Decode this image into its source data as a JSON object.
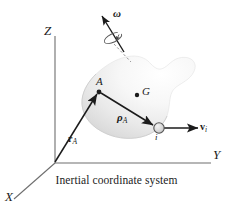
{
  "figure": {
    "caption": "Inertial coordinate system",
    "background_color": "#ffffff",
    "ink_color": "#1b1b1b",
    "body_fill_light": "#fbfbfb",
    "body_fill_dark": "#d2d2d2",
    "axes": [
      {
        "name": "Z",
        "label": "Z"
      },
      {
        "name": "Y",
        "label": "Y"
      },
      {
        "name": "X",
        "label": "X"
      }
    ],
    "points": [
      {
        "name": "A",
        "label": "A"
      },
      {
        "name": "G",
        "label": "G"
      },
      {
        "name": "i",
        "label": "i"
      }
    ],
    "vectors": [
      {
        "name": "omega",
        "label": "ω",
        "sub": ""
      },
      {
        "name": "r_A",
        "label": "r",
        "sub": "A"
      },
      {
        "name": "rho_A",
        "label": "ρ",
        "sub": "A"
      },
      {
        "name": "v_i",
        "label": "v",
        "sub": "i"
      }
    ],
    "labels": {
      "axis_z": "Z",
      "axis_y": "Y",
      "axis_x": "X",
      "point_a": "A",
      "point_g": "G",
      "particle_i": "i",
      "omega": "ω",
      "r_base": "r",
      "r_sub": "A",
      "rho_base": "ρ",
      "rho_sub": "A",
      "v_base": "v",
      "v_sub": "i"
    }
  }
}
